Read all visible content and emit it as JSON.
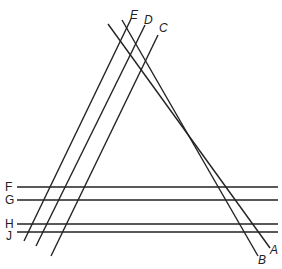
{
  "diagram": {
    "line_color": "#222222",
    "labels": {
      "E": "E",
      "D": "D",
      "C": "C",
      "F": "F",
      "G": "G",
      "H": "H",
      "J": "J",
      "A": "A",
      "B": "B"
    },
    "lines": [
      {
        "id": "E",
        "x1": 131,
        "y1": 19,
        "x2": 24,
        "y2": 241
      },
      {
        "id": "D",
        "x1": 145,
        "y1": 25,
        "x2": 36,
        "y2": 246
      },
      {
        "id": "C",
        "x1": 158,
        "y1": 35,
        "x2": 51,
        "y2": 256
      },
      {
        "id": "A",
        "x1": 108,
        "y1": 24,
        "x2": 270,
        "y2": 248
      },
      {
        "id": "B",
        "x1": 122,
        "y1": 20,
        "x2": 258,
        "y2": 256
      },
      {
        "id": "F",
        "x1": 17,
        "y1": 187,
        "x2": 278,
        "y2": 187
      },
      {
        "id": "G",
        "x1": 17,
        "y1": 200,
        "x2": 278,
        "y2": 200
      },
      {
        "id": "H",
        "x1": 17,
        "y1": 224,
        "x2": 278,
        "y2": 224
      },
      {
        "id": "J",
        "x1": 17,
        "y1": 232,
        "x2": 278,
        "y2": 232
      }
    ]
  }
}
